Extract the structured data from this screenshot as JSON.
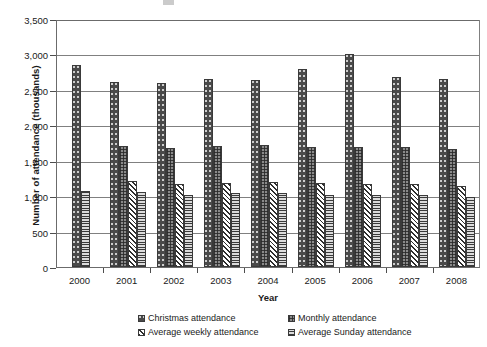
{
  "chart_data": {
    "type": "bar",
    "title": "",
    "xlabel": "Year",
    "ylabel": "Number of attendance (thousands)",
    "categories": [
      "2000",
      "2001",
      "2002",
      "2003",
      "2004",
      "2005",
      "2006",
      "2007",
      "2008"
    ],
    "ylim": [
      0,
      3500
    ],
    "ytick_values": [
      0,
      500,
      1000,
      1500,
      2000,
      2500,
      3000,
      3500
    ],
    "ytick_labels": [
      "0",
      "500",
      "1,000",
      "1,500",
      "2,000",
      "2,500",
      "3,000",
      "3,500"
    ],
    "grid": true,
    "legend_position": "bottom",
    "series": [
      {
        "name": "Christmas attendance",
        "pattern": "dark-dotted",
        "color": "#4a4a4a",
        "values": [
          2850,
          2610,
          2600,
          2660,
          2640,
          2800,
          3000,
          2680,
          2660
        ]
      },
      {
        "name": "Monthly attendance",
        "pattern": "dark-checkered",
        "color": "#8a8a8a",
        "values": [
          null,
          1710,
          1680,
          1710,
          1720,
          1700,
          1700,
          1700,
          1670
        ]
      },
      {
        "name": "Average weekly attendance",
        "pattern": "diagonal-crosshatch",
        "color": "#ffffff",
        "values": [
          null,
          1210,
          1170,
          1180,
          1200,
          1190,
          1170,
          1170,
          1150
        ]
      },
      {
        "name": "Average Sunday attendance",
        "pattern": "horizontal-lines",
        "color": "#c9c9c9",
        "values": [
          1070,
          1060,
          1020,
          1040,
          1040,
          1020,
          1020,
          1020,
          990
        ]
      }
    ]
  }
}
